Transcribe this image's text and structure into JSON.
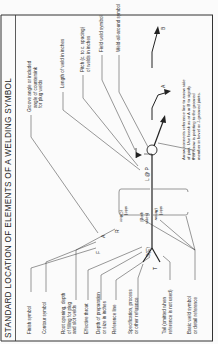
{
  "title": "STANDARD LOCATION OF ELEMENTS OF A WELDING SYMBOL",
  "left_labels": [
    {
      "id": "finish",
      "text": "Finish symbol"
    },
    {
      "id": "contour",
      "text": "Contour symbol"
    },
    {
      "id": "root1",
      "text": "Root opening, depth"
    },
    {
      "id": "root2",
      "text": "of filling for plug"
    },
    {
      "id": "root3",
      "text": "and slot welds"
    },
    {
      "id": "throat",
      "text": "Effective throat"
    },
    {
      "id": "depth1",
      "text": "Depth of preparation"
    },
    {
      "id": "depth2",
      "text": "or size in inches"
    },
    {
      "id": "refline",
      "text": "Reference line"
    },
    {
      "id": "spec1",
      "text": "Specification, process"
    },
    {
      "id": "spec2",
      "text": "or other reference"
    },
    {
      "id": "tail1",
      "text": "Tail (omitted when"
    },
    {
      "id": "tail2",
      "text": "reference is not used)"
    },
    {
      "id": "basic1",
      "text": "Basic weld symbol"
    },
    {
      "id": "basic2",
      "text": "or detail reference"
    }
  ],
  "right_labels": [
    {
      "id": "groove1",
      "text": "Groove angle or included"
    },
    {
      "id": "groove2",
      "text": "angle of countersink"
    },
    {
      "id": "groove3",
      "text": "for plug welds"
    },
    {
      "id": "length",
      "text": "Length of weld in inches"
    },
    {
      "id": "pitch1",
      "text": "Pitch (c. to c. spacing)"
    },
    {
      "id": "pitch2",
      "text": "of welds in inches"
    },
    {
      "id": "field",
      "text": "Field weld symbol"
    },
    {
      "id": "allaround",
      "text": "Weld-all-around symbol"
    }
  ],
  "note": [
    "Arrow connects reference line to arrow side",
    "of joint. Use break as at A or B to signify",
    "that arrow is pointing to the grooved",
    "member in bevel or J-grooved joints."
  ],
  "symbols": {
    "F": "F",
    "A": "A",
    "R": "R",
    "S": "S(E)",
    "T": "T",
    "L": "L @ P",
    "breakA": "A",
    "breakB": "B"
  },
  "sides": {
    "other": [
      "(Other",
      "side)"
    ],
    "arrow": [
      "(Arrow",
      "side)"
    ],
    "both": [
      "(Both",
      "sides)"
    ]
  },
  "colors": {
    "ink": "#222222",
    "paper": "#fbfbfb"
  }
}
